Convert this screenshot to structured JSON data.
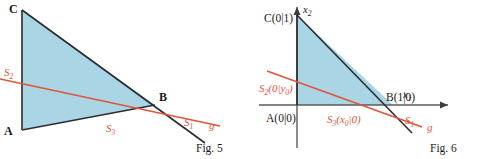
{
  "figures": [
    {
      "id": "fig5",
      "caption": "Fig. 5",
      "labels": {
        "vertex_a": "A",
        "vertex_b": "B",
        "vertex_c": "C",
        "s1": "S",
        "s1_sub": "1",
        "s2": "S",
        "s2_sub": "2",
        "s3": "S",
        "s3_sub": "3",
        "line_g": "g"
      },
      "geometry": {
        "triangle": "A(22,130) B(155,105) C(22,10)",
        "fill_color": "#a9d5e4",
        "edge_color": "#2b2b33",
        "secant_color": "#e1543a"
      }
    },
    {
      "id": "fig6",
      "caption": "Fig. 6",
      "labels": {
        "vertex_a": "A(0|0)",
        "vertex_b": "B(1|0)",
        "vertex_c": "C(0|1)",
        "axis_x1": "x",
        "axis_x1_sub": "1",
        "axis_x2": "x",
        "axis_x2_sub": "2",
        "s1": "S",
        "s1_sub": "1",
        "s2": "S",
        "s2_sub": "2",
        "s2_coords": "(0|y",
        "s2_coords_sub": "0",
        "s2_coords_end": ")",
        "s3": "S",
        "s3_sub": "3",
        "s3_coords": "(x",
        "s3_coords_sub": "0",
        "s3_coords_end": "|0)",
        "line_g": "g"
      },
      "geometry": {
        "origin": "(297,105)",
        "triangle": "A(297,105) B(393,105) C(297,15)",
        "fill_color": "#a9d5e4",
        "edge_color": "#2b2b33",
        "axis_color": "#5a5a5a",
        "secant_color": "#e1543a"
      }
    }
  ],
  "colors": {
    "triangle_fill": "#a9d5e4",
    "triangle_edge": "#2b2b33",
    "secant_line": "#e1543a",
    "axis": "#5a5a5a",
    "text": "#1a1a1a"
  }
}
